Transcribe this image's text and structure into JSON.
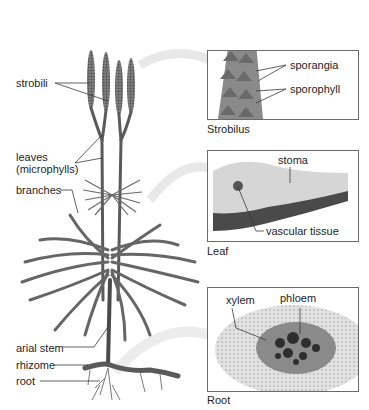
{
  "diagram": {
    "plant_labels": {
      "strobili": "strobili",
      "leaves": "leaves",
      "leaves_sub": "(microphylls)",
      "branches": "branches",
      "arial_stem": "arial stem",
      "rhizome": "rhizome",
      "root": "root"
    },
    "panels": [
      {
        "id": "strobilus",
        "caption": "Strobilus",
        "labels": [
          "sporangia",
          "sporophyll"
        ]
      },
      {
        "id": "leaf",
        "caption": "Leaf",
        "labels": [
          "stoma",
          "vascular tissue"
        ]
      },
      {
        "id": "root",
        "caption": "Root",
        "labels": [
          "xylem",
          "phloem"
        ]
      }
    ],
    "colors": {
      "plant": "#6b6b6b",
      "plant_dark": "#3f3f3f",
      "leader_line": "#3a3a3a",
      "arrow": "#e6e6e6",
      "box_border": "#6a6a6a",
      "tissue_light": "#d9d9d9",
      "tissue_dark": "#4a4a4a"
    }
  }
}
